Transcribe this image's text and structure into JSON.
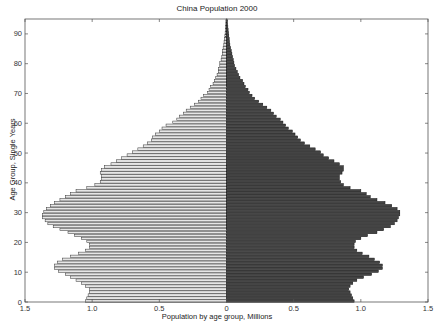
{
  "chart_data": {
    "type": "bar",
    "orientation": "horizontal",
    "subtype": "population-pyramid",
    "title": "China Population 2000",
    "xlabel": "Population by age group, Millions",
    "ylabel": "Age Group, Single Years",
    "xlim": [
      -1.5,
      1.5
    ],
    "ylim": [
      0,
      95
    ],
    "x_ticks": [
      -1.5,
      -1.0,
      -0.5,
      0,
      0.5,
      1.0,
      1.5
    ],
    "x_tick_labels": [
      "1.5",
      "1.0",
      "0.5",
      "0",
      "0.5",
      "1.0",
      "1.5"
    ],
    "y_ticks": [
      0,
      10,
      20,
      30,
      40,
      50,
      60,
      70,
      80,
      90
    ],
    "y_tick_labels": [
      "0",
      "10",
      "20",
      "30",
      "40",
      "50",
      "60",
      "70",
      "80",
      "90"
    ],
    "grid": false,
    "legend": null,
    "ages": [
      0,
      1,
      2,
      3,
      4,
      5,
      6,
      7,
      8,
      9,
      10,
      11,
      12,
      13,
      14,
      15,
      16,
      17,
      18,
      19,
      20,
      21,
      22,
      23,
      24,
      25,
      26,
      27,
      28,
      29,
      30,
      31,
      32,
      33,
      34,
      35,
      36,
      37,
      38,
      39,
      40,
      41,
      42,
      43,
      44,
      45,
      46,
      47,
      48,
      49,
      50,
      51,
      52,
      53,
      54,
      55,
      56,
      57,
      58,
      59,
      60,
      61,
      62,
      63,
      64,
      65,
      66,
      67,
      68,
      69,
      70,
      71,
      72,
      73,
      74,
      75,
      76,
      77,
      78,
      79,
      80,
      81,
      82,
      83,
      84,
      85,
      86,
      87,
      88,
      89,
      90,
      91,
      92,
      93,
      94,
      95
    ],
    "series": [
      {
        "name": "Male",
        "side": "left",
        "fill": "#e6e6e6",
        "edge": "#333333",
        "values": [
          1.05,
          1.04,
          1.03,
          1.02,
          1.02,
          1.05,
          1.08,
          1.12,
          1.16,
          1.2,
          1.25,
          1.28,
          1.28,
          1.26,
          1.22,
          1.16,
          1.1,
          1.05,
          1.02,
          1.02,
          1.04,
          1.08,
          1.13,
          1.18,
          1.24,
          1.29,
          1.33,
          1.35,
          1.37,
          1.37,
          1.36,
          1.34,
          1.31,
          1.28,
          1.24,
          1.2,
          1.16,
          1.12,
          1.04,
          0.98,
          0.94,
          0.93,
          0.93,
          0.94,
          0.93,
          0.91,
          0.86,
          0.82,
          0.78,
          0.74,
          0.7,
          0.66,
          0.62,
          0.59,
          0.56,
          0.55,
          0.53,
          0.5,
          0.48,
          0.45,
          0.4,
          0.37,
          0.35,
          0.32,
          0.3,
          0.27,
          0.24,
          0.21,
          0.19,
          0.17,
          0.14,
          0.13,
          0.12,
          0.1,
          0.09,
          0.08,
          0.07,
          0.06,
          0.06,
          0.05,
          0.05,
          0.04,
          0.035,
          0.03,
          0.028,
          0.025,
          0.02,
          0.018,
          0.015,
          0.012,
          0.01,
          0.008,
          0.006,
          0.005,
          0.004,
          0.003
        ]
      },
      {
        "name": "Female",
        "side": "right",
        "fill": "#444444",
        "edge": "#111111",
        "values": [
          0.95,
          0.94,
          0.93,
          0.92,
          0.91,
          0.92,
          0.94,
          0.97,
          1.02,
          1.08,
          1.13,
          1.16,
          1.16,
          1.14,
          1.1,
          1.06,
          1.01,
          0.97,
          0.95,
          0.95,
          0.96,
          1.0,
          1.05,
          1.12,
          1.17,
          1.22,
          1.25,
          1.27,
          1.28,
          1.29,
          1.29,
          1.27,
          1.23,
          1.18,
          1.12,
          1.07,
          1.04,
          1.0,
          0.92,
          0.87,
          0.85,
          0.84,
          0.84,
          0.86,
          0.87,
          0.87,
          0.84,
          0.8,
          0.76,
          0.72,
          0.7,
          0.66,
          0.62,
          0.58,
          0.55,
          0.53,
          0.51,
          0.49,
          0.46,
          0.44,
          0.42,
          0.4,
          0.37,
          0.35,
          0.33,
          0.3,
          0.27,
          0.24,
          0.21,
          0.19,
          0.17,
          0.16,
          0.14,
          0.13,
          0.12,
          0.1,
          0.09,
          0.08,
          0.07,
          0.06,
          0.055,
          0.05,
          0.045,
          0.04,
          0.035,
          0.03,
          0.025,
          0.022,
          0.02,
          0.017,
          0.015,
          0.012,
          0.01,
          0.008,
          0.006,
          0.004
        ]
      }
    ]
  },
  "page": {
    "title": "China Population 2000",
    "xlabel": "Population by age group, Millions",
    "ylabel": "Age Group, Single Years"
  }
}
